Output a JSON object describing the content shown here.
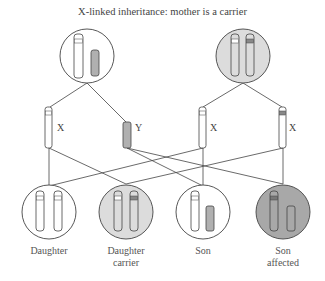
{
  "title": "X-linked inheritance: mother is a carrier",
  "colors": {
    "line": "#444444",
    "father_circle_fill": "#ffffff",
    "carrier_circle_fill": "#dcdcdc",
    "affected_circle_fill": "#a8a8a8",
    "y_chromosome_fill": "#b0b0b0",
    "mutant_band": "#888888"
  },
  "parents": [
    {
      "role": "father",
      "chromosomes": [
        "X normal",
        "Y"
      ]
    },
    {
      "role": "mother",
      "chromosomes": [
        "X normal",
        "X carrier"
      ]
    }
  ],
  "gametes": [
    {
      "label": "X",
      "parent": "father"
    },
    {
      "label": "Y",
      "parent": "father"
    },
    {
      "label": "X",
      "parent": "mother"
    },
    {
      "label": "X",
      "parent": "mother"
    }
  ],
  "offspring": [
    {
      "label_line1": "Daughter",
      "label_line2": ""
    },
    {
      "label_line1": "Daughter",
      "label_line2": "carrier"
    },
    {
      "label_line1": "Son",
      "label_line2": ""
    },
    {
      "label_line1": "Son",
      "label_line2": "affected"
    }
  ]
}
